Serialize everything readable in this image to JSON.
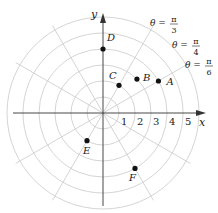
{
  "diagram": {
    "type": "polar-grid",
    "origin_px": [
      103,
      113
    ],
    "unit_px": 16,
    "circles": [
      1,
      2,
      3,
      4,
      5,
      6
    ],
    "ray_step_deg": 30,
    "colors": {
      "grid": "#cfcfcf",
      "axis": "#333333",
      "point": "#111111",
      "text": "#222222"
    },
    "axes": {
      "x_label": "x",
      "y_label": "y"
    },
    "ticks": [
      "1",
      "2",
      "3",
      "4",
      "5"
    ],
    "angle_labels": [
      {
        "theta": "θ = ",
        "num": "π",
        "den": "3",
        "x": 150,
        "y": 26
      },
      {
        "theta": "θ = ",
        "num": "π",
        "den": "4",
        "x": 172,
        "y": 48
      },
      {
        "theta": "θ = ",
        "num": "π",
        "den": "6",
        "x": 185,
        "y": 68
      }
    ],
    "points": [
      {
        "name": "A",
        "r": 4,
        "theta_deg": 30,
        "label_dx": 8,
        "label_dy": 4
      },
      {
        "name": "B",
        "r": 3,
        "theta_deg": 45,
        "label_dx": 6,
        "label_dy": 2
      },
      {
        "name": "C",
        "r": 2,
        "theta_deg": 60,
        "label_dx": -10,
        "label_dy": -6
      },
      {
        "name": "D",
        "r": 4,
        "theta_deg": 90,
        "label_dx": 4,
        "label_dy": -8
      },
      {
        "name": "E",
        "r": 2,
        "theta_deg": 240,
        "label_dx": -4,
        "label_dy": 13
      },
      {
        "name": "F",
        "r": 4,
        "theta_deg": 300,
        "label_dx": -6,
        "label_dy": 13
      }
    ]
  }
}
